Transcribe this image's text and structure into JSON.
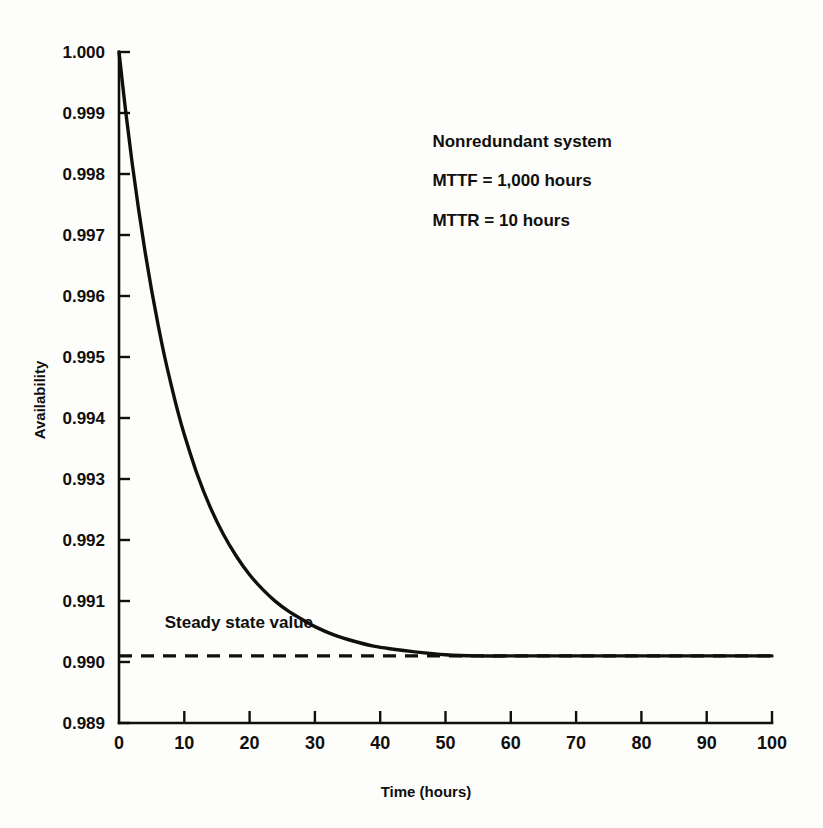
{
  "chart_data": {
    "type": "line",
    "title": "",
    "xlabel": "Time (hours)",
    "ylabel": "Availability",
    "xlim": [
      0,
      100
    ],
    "ylim": [
      0.989,
      1.0
    ],
    "grid": false,
    "legend": "none",
    "x_ticks": [
      "0",
      "10",
      "20",
      "30",
      "40",
      "50",
      "60",
      "70",
      "80",
      "90",
      "100"
    ],
    "x_tick_values": [
      0,
      10,
      20,
      30,
      40,
      50,
      60,
      70,
      80,
      90,
      100
    ],
    "y_ticks": [
      "0.989",
      "0.990",
      "0.991",
      "0.992",
      "0.993",
      "0.994",
      "0.995",
      "0.996",
      "0.997",
      "0.998",
      "0.999",
      "1.000"
    ],
    "y_tick_values": [
      0.989,
      0.99,
      0.991,
      0.992,
      0.993,
      0.994,
      0.995,
      0.996,
      0.997,
      0.998,
      0.999,
      1.0
    ],
    "series": [
      {
        "name": "Availability A(t)",
        "type": "line",
        "style": "solid",
        "color": "#100f0d",
        "x": [
          0,
          1,
          2,
          3,
          4,
          5,
          6,
          7,
          8,
          9,
          10,
          12,
          14,
          16,
          18,
          20,
          22,
          24,
          26,
          28,
          30,
          33,
          36,
          39,
          42,
          45,
          50,
          55,
          60,
          65,
          70,
          75,
          80,
          85,
          90,
          95,
          100
        ],
        "y": [
          1.0,
          0.99905,
          0.99819,
          0.99742,
          0.99672,
          0.99609,
          0.99552,
          0.995,
          0.99454,
          0.99411,
          0.99373,
          0.99307,
          0.99253,
          0.99209,
          0.99173,
          0.99143,
          0.99119,
          0.99099,
          0.99083,
          0.9907,
          0.99058,
          0.99044,
          0.99034,
          0.99026,
          0.99021,
          0.99017,
          0.99012,
          0.9901,
          0.9901,
          0.9901,
          0.9901,
          0.9901,
          0.9901,
          0.9901,
          0.9901,
          0.9901,
          0.9901
        ]
      },
      {
        "name": "Steady state value",
        "type": "line",
        "style": "dashed",
        "color": "#100f0d",
        "x": [
          0,
          100
        ],
        "y": [
          0.9901,
          0.9901
        ]
      }
    ],
    "annotations": [
      {
        "name": "steady-state-label",
        "text": "Steady state value",
        "x": 7,
        "y": 0.99055
      },
      {
        "name": "system-note-line1",
        "text": "Nonredundant system",
        "x": 48,
        "y": 0.99845
      },
      {
        "name": "system-note-line2",
        "text": "MTTF  =  1,000 hours",
        "x": 48,
        "y": 0.9978
      },
      {
        "name": "system-note-line3",
        "text": "MTTR  =  10 hours",
        "x": 48,
        "y": 0.99715
      }
    ]
  },
  "figure": {
    "background_color": "#fdfdfb",
    "ink_color": "#100f0d"
  }
}
